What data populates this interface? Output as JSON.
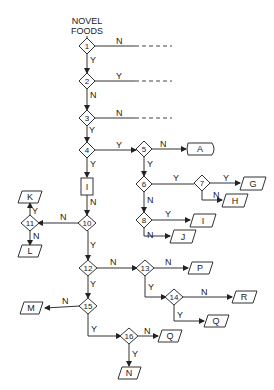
{
  "title": [
    "NOVEL",
    "FOODS"
  ],
  "decisions": [
    {
      "id": "1",
      "x": 87,
      "y": 46
    },
    {
      "id": "2",
      "x": 87,
      "y": 81
    },
    {
      "id": "3",
      "x": 87,
      "y": 118
    },
    {
      "id": "4",
      "x": 87,
      "y": 150
    },
    {
      "id": "5",
      "x": 144,
      "y": 149
    },
    {
      "id": "6",
      "x": 144,
      "y": 184
    },
    {
      "id": "7",
      "x": 202,
      "y": 183
    },
    {
      "id": "8",
      "x": 144,
      "y": 220
    },
    {
      "id": "10",
      "x": 87,
      "y": 223
    },
    {
      "id": "11",
      "x": 30,
      "y": 223
    },
    {
      "id": "12",
      "x": 88,
      "y": 268
    },
    {
      "id": "13",
      "x": 145,
      "y": 268
    },
    {
      "id": "14",
      "x": 174,
      "y": 297
    },
    {
      "id": "15",
      "x": 88,
      "y": 306
    },
    {
      "id": "16",
      "x": 129,
      "y": 336
    }
  ],
  "process_box": {
    "label": "I",
    "x": 87,
    "y": 186
  },
  "terminal": {
    "label": "A",
    "x": 201,
    "y": 149
  },
  "outcomes": [
    {
      "label": "G",
      "x": 253,
      "y": 184
    },
    {
      "label": "H",
      "x": 235,
      "y": 200
    },
    {
      "label": "I",
      "x": 203,
      "y": 220
    },
    {
      "label": "J",
      "x": 183,
      "y": 236
    },
    {
      "label": "K",
      "x": 30,
      "y": 197
    },
    {
      "label": "L",
      "x": 30,
      "y": 251
    },
    {
      "label": "P",
      "x": 201,
      "y": 268
    },
    {
      "label": "R",
      "x": 245,
      "y": 297
    },
    {
      "label": "Q",
      "x": 217,
      "y": 321
    },
    {
      "label": "M",
      "x": 32,
      "y": 309
    },
    {
      "label": "Q",
      "x": 171,
      "y": 336
    },
    {
      "label": "N",
      "x": 129,
      "y": 373
    }
  ],
  "edge_labels": [
    {
      "text": "N",
      "x": 116,
      "y": 44
    },
    {
      "text": "Y",
      "x": 90,
      "y": 62
    },
    {
      "text": "Y",
      "x": 116,
      "y": 79
    },
    {
      "text": "N",
      "x": 90,
      "y": 98
    },
    {
      "text": "N",
      "x": 116,
      "y": 116
    },
    {
      "text": "Y",
      "x": 89,
      "y": 131
    },
    {
      "text": "Y",
      "x": 116,
      "y": 147
    },
    {
      "text": "N",
      "x": 160,
      "y": 147
    },
    {
      "text": "Y",
      "x": 90,
      "y": 166
    },
    {
      "text": "Y",
      "x": 147,
      "y": 166
    },
    {
      "text": "Y",
      "x": 173,
      "y": 181
    },
    {
      "text": "Y",
      "x": 223,
      "y": 181
    },
    {
      "text": "N",
      "x": 214,
      "y": 197
    },
    {
      "text": "N",
      "x": 148,
      "y": 201
    },
    {
      "text": "Y",
      "x": 166,
      "y": 217
    },
    {
      "text": "N",
      "x": 147,
      "y": 237
    },
    {
      "text": "N",
      "x": 90,
      "y": 204
    },
    {
      "text": "N",
      "x": 60,
      "y": 220
    },
    {
      "text": "Y",
      "x": 32,
      "y": 213
    },
    {
      "text": "N",
      "x": 33,
      "y": 236
    },
    {
      "text": "Y",
      "x": 90,
      "y": 247
    },
    {
      "text": "N",
      "x": 112,
      "y": 265
    },
    {
      "text": "N",
      "x": 165,
      "y": 265
    },
    {
      "text": "Y",
      "x": 148,
      "y": 288
    },
    {
      "text": "N",
      "x": 201,
      "y": 294
    },
    {
      "text": "Y",
      "x": 177,
      "y": 317
    },
    {
      "text": "Y",
      "x": 90,
      "y": 285
    },
    {
      "text": "N",
      "x": 64,
      "y": 303
    },
    {
      "text": "Y",
      "x": 91,
      "y": 331
    },
    {
      "text": "N",
      "x": 145,
      "y": 333
    },
    {
      "text": "Y",
      "x": 132,
      "y": 355
    }
  ]
}
